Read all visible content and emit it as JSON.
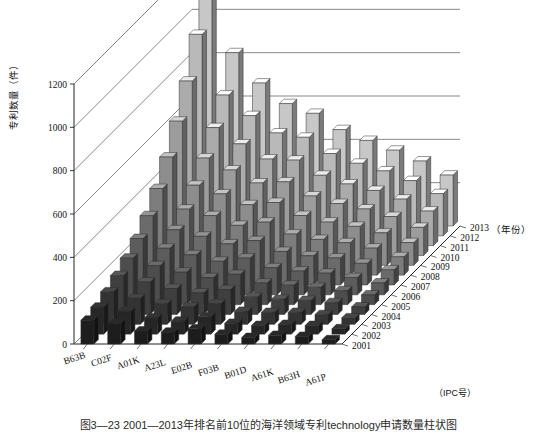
{
  "figure": {
    "caption": "图3—23  2001—2013年排名前10位的海洋领域专利technology申请数量柱状图",
    "background": "#ffffff"
  },
  "chart_data": {
    "type": "bar",
    "title": "",
    "subtitle": "",
    "projection": "3d",
    "xlabel": "（IPC号）",
    "ylabel": "专利数量（件）",
    "zlabel": "（年份）",
    "ylim": [
      0,
      1200
    ],
    "yticks": [
      0,
      200,
      400,
      600,
      800,
      1000,
      1200
    ],
    "ytick_labels": [
      "0",
      "200",
      "400",
      "600",
      "800",
      "1000",
      "1200"
    ],
    "grid": true,
    "legend": "none",
    "categories": [
      "B63B",
      "C02F",
      "A01K",
      "A23L",
      "E02B",
      "F03B",
      "B01D",
      "A61K",
      "B63H",
      "A61P"
    ],
    "depth_axis": [
      "2001",
      "2002",
      "2003",
      "2004",
      "2005",
      "2006",
      "2007",
      "2008",
      "2009",
      "2010",
      "2011",
      "2012",
      "2013"
    ],
    "series": [
      {
        "name": "2001",
        "shade": "#1d1d1d",
        "values": [
          110,
          95,
          60,
          55,
          70,
          45,
          30,
          40,
          35,
          20
        ]
      },
      {
        "name": "2002",
        "shade": "#262626",
        "values": [
          125,
          105,
          75,
          60,
          80,
          50,
          40,
          45,
          40,
          25
        ]
      },
      {
        "name": "2003",
        "shade": "#333333",
        "values": [
          150,
          120,
          95,
          80,
          95,
          60,
          55,
          55,
          45,
          30
        ]
      },
      {
        "name": "2004",
        "shade": "#3f3f3f",
        "values": [
          180,
          150,
          120,
          100,
          115,
          80,
          70,
          65,
          55,
          35
        ]
      },
      {
        "name": "2005",
        "shade": "#4d4d4d",
        "values": [
          215,
          180,
          150,
          125,
          140,
          100,
          90,
          80,
          65,
          45
        ]
      },
      {
        "name": "2006",
        "shade": "#5c5c5c",
        "values": [
          260,
          215,
          185,
          155,
          170,
          125,
          110,
          100,
          80,
          55
        ]
      },
      {
        "name": "2007",
        "shade": "#6b6b6b",
        "values": [
          320,
          255,
          225,
          190,
          205,
          155,
          135,
          125,
          100,
          70
        ]
      },
      {
        "name": "2008",
        "shade": "#7d7d7d",
        "values": [
          400,
          305,
          275,
          230,
          245,
          190,
          165,
          150,
          125,
          85
        ]
      },
      {
        "name": "2009",
        "shade": "#8d8d8d",
        "values": [
          500,
          370,
          330,
          280,
          290,
          230,
          200,
          180,
          150,
          105
        ]
      },
      {
        "name": "2010",
        "shade": "#9c9c9c",
        "values": [
          620,
          450,
          395,
          335,
          340,
          275,
          240,
          215,
          180,
          130
        ]
      },
      {
        "name": "2011",
        "shade": "#ababab",
        "values": [
          760,
          545,
          470,
          400,
          395,
          325,
          285,
          255,
          215,
          160
        ]
      },
      {
        "name": "2012",
        "shade": "#b9b9b9",
        "values": [
          930,
          650,
          555,
          475,
          455,
          380,
          335,
          300,
          255,
          195
        ]
      },
      {
        "name": "2013",
        "shade": "#c7c7c7",
        "values": [
          1185,
          800,
          660,
          565,
          520,
          445,
          395,
          350,
          300,
          235
        ]
      }
    ]
  },
  "geometry": {
    "origin_x": 74,
    "origin_y": 344,
    "y_top": 84,
    "x_span": 268,
    "depth_dx": 118,
    "depth_dy": -118,
    "bar_w": 13,
    "bar_d": 6
  }
}
